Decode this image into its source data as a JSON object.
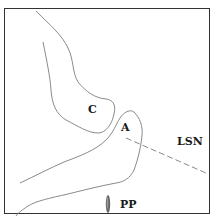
{
  "diagram": {
    "labels": {
      "c": "C",
      "a": "A",
      "lsn": "LSN",
      "pp": "PP"
    },
    "colors": {
      "frame": "#333333",
      "outline": "#8a8a8a",
      "dashed_line": "#8a8a8a",
      "pp_marker": "#666666",
      "text": "#1a1a1a"
    },
    "elements": [
      {
        "id": "structure-c",
        "type": "outline-curve",
        "label": "C"
      },
      {
        "id": "structure-a",
        "type": "outline-curve",
        "label": "A"
      },
      {
        "id": "lsn-line",
        "type": "dashed-line",
        "label": "LSN"
      },
      {
        "id": "pp-marker",
        "type": "elliptical-marker",
        "label": "PP"
      }
    ]
  }
}
